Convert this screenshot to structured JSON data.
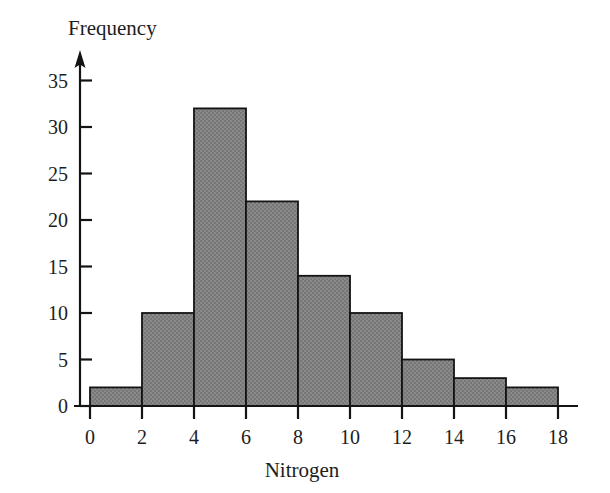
{
  "chart_data": {
    "type": "bar",
    "subtype": "histogram",
    "title": "",
    "xlabel": "Nitrogen",
    "ylabel": "Frequency",
    "bin_width": 2,
    "bin_edges": [
      0,
      2,
      4,
      6,
      8,
      10,
      12,
      14,
      16,
      18
    ],
    "categories": [
      "0-2",
      "2-4",
      "4-6",
      "6-8",
      "8-10",
      "10-12",
      "12-14",
      "14-16",
      "16-18"
    ],
    "values": [
      2,
      10,
      32,
      22,
      14,
      10,
      5,
      3,
      2
    ],
    "bars": [
      {
        "bin_start": 0,
        "bin_end": 2,
        "frequency": 2
      },
      {
        "bin_start": 2,
        "bin_end": 4,
        "frequency": 10
      },
      {
        "bin_start": 4,
        "bin_end": 6,
        "frequency": 32
      },
      {
        "bin_start": 6,
        "bin_end": 8,
        "frequency": 22
      },
      {
        "bin_start": 8,
        "bin_end": 10,
        "frequency": 14
      },
      {
        "bin_start": 10,
        "bin_end": 12,
        "frequency": 10
      },
      {
        "bin_start": 12,
        "bin_end": 14,
        "frequency": 5
      },
      {
        "bin_start": 14,
        "bin_end": 16,
        "frequency": 3
      },
      {
        "bin_start": 16,
        "bin_end": 18,
        "frequency": 2
      }
    ],
    "xlim": [
      0,
      18
    ],
    "ylim": [
      0,
      36
    ],
    "xticks": [
      0,
      2,
      4,
      6,
      8,
      10,
      12,
      14,
      16,
      18
    ],
    "yticks": [
      0,
      5,
      10,
      15,
      20,
      25,
      30,
      35
    ],
    "xtick_labels": [
      "0",
      "2",
      "4",
      "6",
      "8",
      "10",
      "12",
      "14",
      "16",
      "18"
    ],
    "ytick_labels": [
      "0",
      "5",
      "10",
      "15",
      "20",
      "25",
      "30",
      "35"
    ],
    "grid": false,
    "legend": null,
    "bar_fill_color": "#808080",
    "bar_edge_color": "#141414",
    "axis_color": "#141414",
    "background_color": "#ffffff",
    "y_axis_has_arrow": true,
    "total_frequency": 100
  }
}
